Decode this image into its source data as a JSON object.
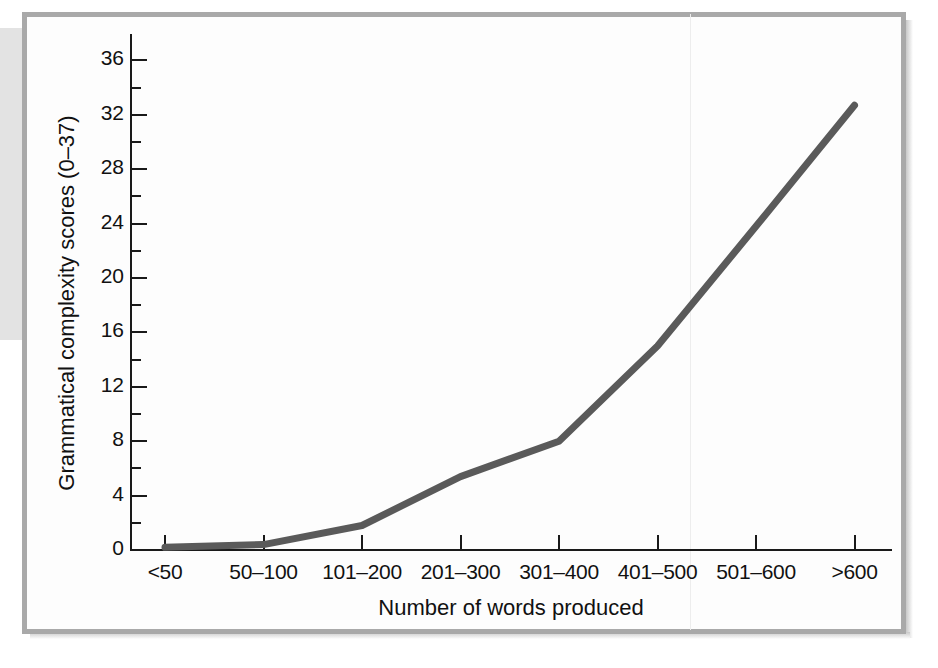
{
  "figure": {
    "frame_color": "#a9a9a9",
    "background_color": "#ffffff"
  },
  "chart_data": {
    "type": "line",
    "title": "",
    "xlabel": "Number of words produced",
    "ylabel": "Grammatical complexity scores (0–37)",
    "categories": [
      "<50",
      "50–100",
      "101–200",
      "201–300",
      "301–400",
      "401–500",
      "501–600",
      ">600"
    ],
    "values": [
      0.2,
      0.4,
      1.8,
      5.4,
      8.0,
      15.0,
      23.8,
      32.7
    ],
    "ylim": [
      0,
      38
    ],
    "yticks": [
      0,
      4,
      8,
      12,
      16,
      20,
      24,
      28,
      32,
      36
    ],
    "ytick_labels": [
      "0",
      "4",
      "8",
      "12",
      "16",
      "20",
      "24",
      "28",
      "32",
      "36"
    ],
    "yminor_ticks": [
      2,
      6,
      10,
      14,
      18,
      22,
      26,
      30,
      34
    ],
    "grid": false,
    "legend": false,
    "series_color": "#5a5a5a",
    "series_width": 7,
    "axis_color": "#1a1a1a"
  }
}
